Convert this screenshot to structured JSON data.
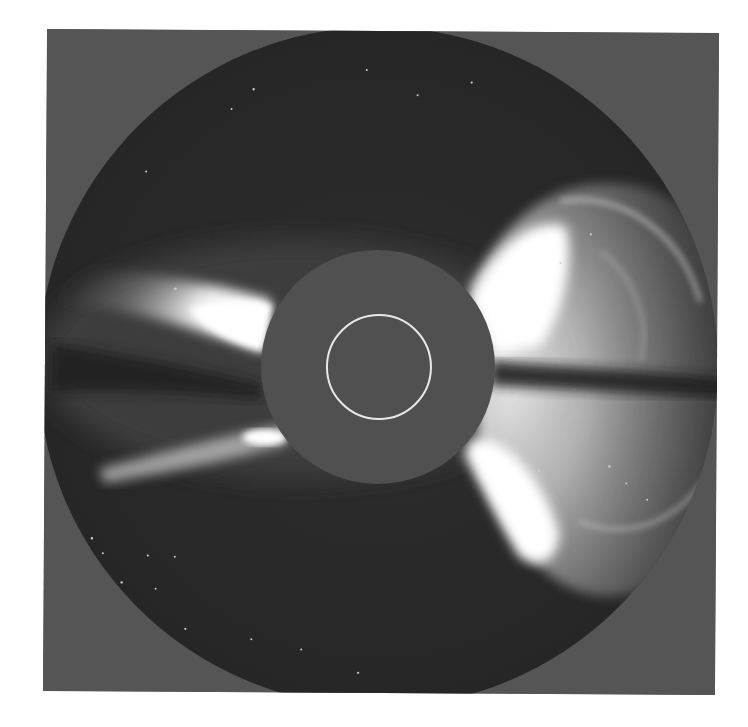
{
  "image": {
    "subject": "Coronagraph view of a coronal mass ejection",
    "colors": {
      "frame_background": "#555555",
      "field_of_view": "#2b2b2b",
      "occulter_disk": "#505050",
      "solar_limb_ring": "#e8e8e8",
      "streamer_bright": "#ffffff"
    },
    "geometry": {
      "frame": {
        "x": 45,
        "y": 31,
        "width": 672,
        "height": 662
      },
      "field_of_view_circle": {
        "cx": 378,
        "cy": 367,
        "r": 340
      },
      "occulter_disk": {
        "cx": 378,
        "cy": 367,
        "r": 117
      },
      "solar_limb_ring": {
        "cx": 379,
        "cy": 367,
        "r": 52
      }
    },
    "features": [
      "Bright streamer left-upper (east) at ~y 300-350",
      "Fainter streamer left-lower at ~y 430-450",
      "Large bright CME loop structure on right (west) side, upper and lower lobes",
      "Dark equatorial lane on right side at ~y 370",
      "Scattered background stars"
    ]
  }
}
